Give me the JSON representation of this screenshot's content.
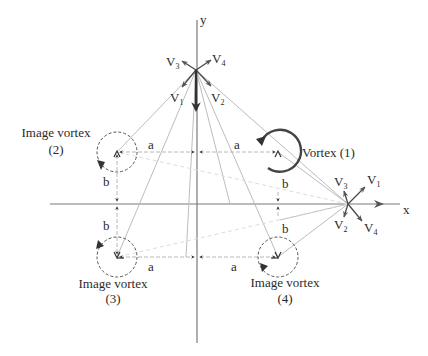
{
  "diagram": {
    "axes": {
      "x_label": "x",
      "y_label": "y"
    },
    "real_vortex": {
      "label": "Vortex (1)"
    },
    "image_vortices": [
      {
        "line1": "Image vortex",
        "line2": "(2)"
      },
      {
        "line1": "Image vortex",
        "line2": "(3)"
      },
      {
        "line1": "Image vortex",
        "line2": "(4)"
      }
    ],
    "dimensions": {
      "a": "a",
      "b": "b"
    },
    "top_point_vectors": [
      {
        "base": "V",
        "sub": "3"
      },
      {
        "base": "V",
        "sub": "4"
      },
      {
        "base": "V",
        "sub": "1"
      },
      {
        "base": "V",
        "sub": "2"
      }
    ],
    "axis_point_vectors": [
      {
        "base": "V",
        "sub": "3"
      },
      {
        "base": "V",
        "sub": "1"
      },
      {
        "base": "V",
        "sub": "2"
      },
      {
        "base": "V",
        "sub": "4"
      }
    ],
    "colors": {
      "line": "#b4b4b4",
      "axis": "#7a7a7a",
      "vector": "#4a4a4a",
      "text": "#2a2a2a"
    }
  }
}
